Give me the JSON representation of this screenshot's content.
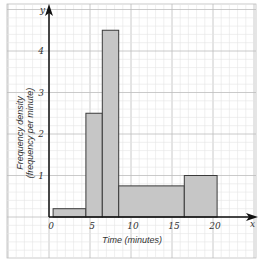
{
  "chart_data": {
    "type": "histogram",
    "title": "",
    "xlabel": "Time (minutes)",
    "ylabel": "Frequency density (frequency per minute)",
    "x_axis_letter": "x",
    "y_axis_letter": "y",
    "xlim": [
      0,
      24
    ],
    "ylim": [
      0,
      5
    ],
    "x_ticks": [
      0,
      5,
      10,
      15,
      20
    ],
    "y_ticks": [
      1,
      2,
      3,
      4
    ],
    "grid": true,
    "bins": [
      {
        "from": 0.5,
        "to": 4.5,
        "frequency_density": 0.2
      },
      {
        "from": 4.5,
        "to": 6.5,
        "frequency_density": 2.5
      },
      {
        "from": 6.5,
        "to": 8.5,
        "frequency_density": 4.5
      },
      {
        "from": 8.5,
        "to": 16.5,
        "frequency_density": 0.75
      },
      {
        "from": 16.5,
        "to": 20.5,
        "frequency_density": 1.0
      }
    ],
    "colors": {
      "bar_fill": "#c6c6c6",
      "bar_stroke": "#3a3a3a",
      "axis": "#111111",
      "grid_major": "#bdbdbd",
      "grid_minor": "#e4e4e4"
    }
  },
  "labels": {
    "xlabel": "Time (minutes)",
    "ylabel_line1": "Frequency density",
    "ylabel_line2": "(frequency per minute)",
    "x_letter": "x",
    "y_letter": "y",
    "origin": "0"
  }
}
